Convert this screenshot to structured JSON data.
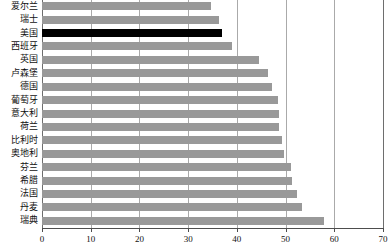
{
  "chart_data": {
    "type": "bar",
    "orientation": "horizontal",
    "title": "",
    "subtitle": "",
    "xlabel": "",
    "ylabel": "",
    "xlim": [
      0,
      70
    ],
    "ylim": null,
    "grid": true,
    "legend": null,
    "xticks": [
      0,
      10,
      20,
      30,
      40,
      50,
      60,
      70
    ],
    "xtick_labels": [
      "0",
      "10",
      "20",
      "30",
      "40",
      "50",
      "60",
      "70"
    ],
    "categories": [
      "爱尔兰",
      "瑞士",
      "美国",
      "西班牙",
      "英国",
      "卢森堡",
      "德国",
      "葡萄牙",
      "意大利",
      "荷兰",
      "比利时",
      "奥地利",
      "芬兰",
      "希腊",
      "法国",
      "丹麦",
      "瑞典"
    ],
    "values": [
      34.6,
      36.4,
      37.0,
      39.0,
      44.6,
      46.4,
      47.2,
      48.5,
      48.6,
      48.7,
      49.2,
      49.6,
      51.2,
      51.4,
      52.3,
      53.4,
      57.8
    ],
    "highlight_category": "美国",
    "colors": {
      "bar": "#999999",
      "highlight_bar": "#000000",
      "gridline": "#aaaaaa",
      "axis": "#4d4d4d",
      "background": "#ffffff",
      "text": "#111111"
    }
  }
}
